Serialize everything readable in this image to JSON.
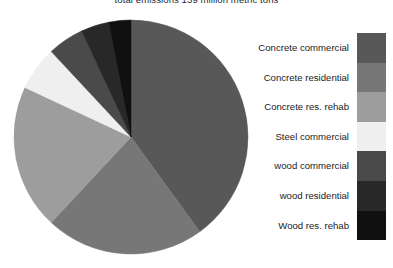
{
  "chart_data": {
    "type": "pie",
    "title": "total emissions 139 million metric tons",
    "xlabel": "",
    "ylabel": "",
    "units": "million metric tons",
    "total": 139,
    "legend_position": "right",
    "grid": false,
    "start_angle_deg": 0,
    "direction": "clockwise",
    "categories": [
      "Concrete commercial",
      "Concrete residential",
      "Concrete res. rehab",
      "Steel commercial",
      "wood commercial",
      "wood residential",
      "Wood res. rehab"
    ],
    "values": [
      40,
      22,
      20,
      6,
      5,
      4,
      3
    ],
    "colors": [
      "#585858",
      "#777777",
      "#9d9d9d",
      "#efefef",
      "#4a4a4a",
      "#282828",
      "#101010"
    ],
    "slices": [
      {
        "label": "Concrete commercial",
        "value": 40,
        "color": "#585858",
        "start_deg": 0,
        "end_deg": 144
      },
      {
        "label": "Concrete residential",
        "value": 22,
        "color": "#777777",
        "start_deg": 144,
        "end_deg": 223
      },
      {
        "label": "Concrete res. rehab",
        "value": 20,
        "color": "#9d9d9d",
        "start_deg": 223,
        "end_deg": 295
      },
      {
        "label": "Steel commercial",
        "value": 6,
        "color": "#efefef",
        "start_deg": 295,
        "end_deg": 317
      },
      {
        "label": "wood commercial",
        "value": 5,
        "color": "#4a4a4a",
        "start_deg": 317,
        "end_deg": 335
      },
      {
        "label": "wood residential",
        "value": 4,
        "color": "#282828",
        "start_deg": 335,
        "end_deg": 349
      },
      {
        "label": "Wood res. rehab",
        "value": 3,
        "color": "#101010",
        "start_deg": 349,
        "end_deg": 360
      }
    ]
  },
  "legend": {
    "items": [
      {
        "label": "Concrete commercial",
        "color": "#585858"
      },
      {
        "label": "Concrete residential",
        "color": "#777777"
      },
      {
        "label": "Concrete res. rehab",
        "color": "#9d9d9d"
      },
      {
        "label": "Steel commercial",
        "color": "#efefef"
      },
      {
        "label": "wood commercial",
        "color": "#4a4a4a"
      },
      {
        "label": "wood residential",
        "color": "#282828"
      },
      {
        "label": "Wood res. rehab",
        "color": "#101010"
      }
    ]
  },
  "pie_geometry": {
    "cx": 131,
    "cy": 137,
    "r": 117
  }
}
